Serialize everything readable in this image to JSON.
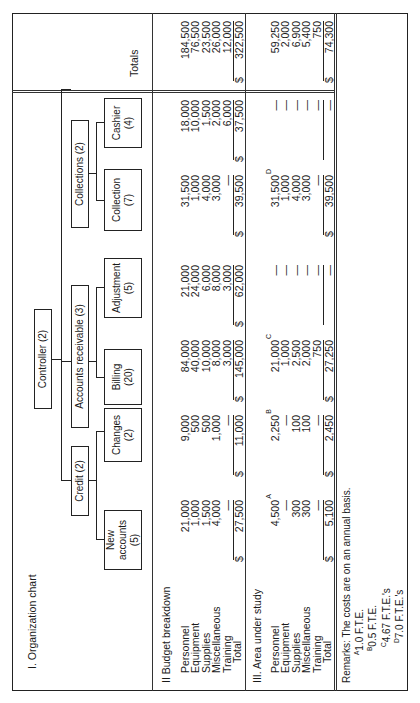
{
  "sections": {
    "org_chart": {
      "title": "I. Organization chart"
    },
    "budget": {
      "title": "II  Budget breakdown"
    },
    "area": {
      "title": "III. Area under study"
    },
    "totals": {
      "title": "Totals"
    }
  },
  "row_labels": [
    "Personnel",
    "Equipment",
    "Supplies",
    "Miscellaneous",
    "Training",
    "Total"
  ],
  "org_chart": {
    "controller": "Controller  (2)",
    "credit": "Credit  (2)",
    "accounts_receivable": "Accounts  receivable  (3)",
    "collections": "Collections  (2)",
    "units": [
      {
        "name": "New accounts",
        "count": "(5)"
      },
      {
        "name": "Changes",
        "count": "(2)"
      },
      {
        "name": "Billing",
        "count": "(20)"
      },
      {
        "name": "Adjustment",
        "count": "(5)"
      },
      {
        "name": "Collection",
        "count": "(7)"
      },
      {
        "name": "Cashier",
        "count": "(4)"
      }
    ]
  },
  "budget_breakdown": {
    "columns": [
      {
        "unit": "New accounts",
        "values": [
          "21,000",
          "1,000",
          "1,500",
          "4,000",
          "—"
        ],
        "total": "27,500"
      },
      {
        "unit": "Changes",
        "values": [
          "9,000",
          "500",
          "500",
          "1,000",
          "—"
        ],
        "total": "11,000"
      },
      {
        "unit": "Billing",
        "values": [
          "84,000",
          "40,000",
          "10,000",
          "8,000",
          "3,000"
        ],
        "total": "145,000"
      },
      {
        "unit": "Adjustment",
        "values": [
          "21,000",
          "24,000",
          "6,000",
          "8,000",
          "3,000"
        ],
        "total": "62,000"
      },
      {
        "unit": "Collection",
        "values": [
          "31,500",
          "1,000",
          "4,000",
          "3,000",
          "—"
        ],
        "total": "39,500"
      },
      {
        "unit": "Cashier",
        "values": [
          "18,000",
          "10,000",
          "1,500",
          "2,000",
          "6,000"
        ],
        "total": "37,500"
      }
    ],
    "totals": {
      "values": [
        "184,500",
        "76,500",
        "23,500",
        "26,000",
        "12,000"
      ],
      "total": "322,500"
    }
  },
  "area_under_study": {
    "columns": [
      {
        "unit": "New accounts",
        "values": [
          "4,500",
          "—",
          "300",
          "300",
          "—"
        ],
        "footnote": "A",
        "total": "5,100"
      },
      {
        "unit": "Changes",
        "values": [
          "2,250",
          "—",
          "100",
          "100",
          "—"
        ],
        "footnote": "B",
        "total": "2,450"
      },
      {
        "unit": "Billing",
        "values": [
          "21,000",
          "1,000",
          "2,500",
          "2,000",
          "750"
        ],
        "footnote": "C",
        "total": "27,250"
      },
      {
        "unit": "Adjustment",
        "values": [
          "—",
          "—",
          "—",
          "—",
          "—"
        ],
        "footnote": "",
        "total": "—"
      },
      {
        "unit": "Collection",
        "values": [
          "31,500",
          "1,000",
          "4,000",
          "3,000",
          "—"
        ],
        "footnote": "D",
        "total": "39,500"
      },
      {
        "unit": "Cashier",
        "values": [
          "—",
          "—",
          "—",
          "—",
          "—"
        ],
        "footnote": "",
        "total": "—"
      }
    ],
    "totals": {
      "values": [
        "59,250",
        "2,000",
        "6,900",
        "5,400",
        "750"
      ],
      "total": "74,300"
    }
  },
  "currency_symbol": "$",
  "remarks": {
    "text": "Remarks:  The costs are on an annual basis.",
    "footnotes": [
      {
        "mark": "A",
        "text": "1.0 F.T.E."
      },
      {
        "mark": "B",
        "text": "0.5 F.T.E."
      },
      {
        "mark": "C",
        "text": "4.67 F.T.E.'s"
      },
      {
        "mark": "D",
        "text": "7.0 F.T.E.'s"
      }
    ]
  }
}
